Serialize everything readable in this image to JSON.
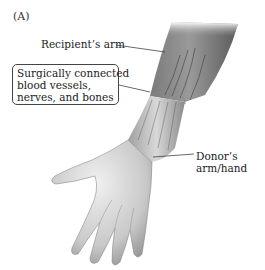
{
  "figure": {
    "panel_label": "(A)",
    "labels": {
      "recipient": "Recipient’s arm",
      "callout_lines": [
        "Surgically connected",
        "blood vessels,",
        "nerves, and bones"
      ],
      "donor_lines": [
        "Donor’s",
        "arm/hand"
      ]
    },
    "colors": {
      "skin_light": "#e6e6e6",
      "skin_mid": "#bdbdbd",
      "skin_dark": "#6a6a6a",
      "leader_line": "#444444"
    }
  }
}
